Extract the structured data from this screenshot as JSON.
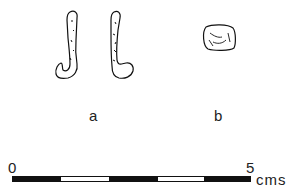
{
  "figure": {
    "objects": [
      {
        "id": "a",
        "label": "a",
        "description": "pair of J-shaped hooks"
      },
      {
        "id": "b",
        "label": "b",
        "description": "small rounded block"
      }
    ]
  },
  "scale_bar": {
    "start_label": "0",
    "end_label": "5",
    "unit": "cms",
    "segments": [
      "black",
      "white",
      "black",
      "white",
      "black"
    ]
  }
}
